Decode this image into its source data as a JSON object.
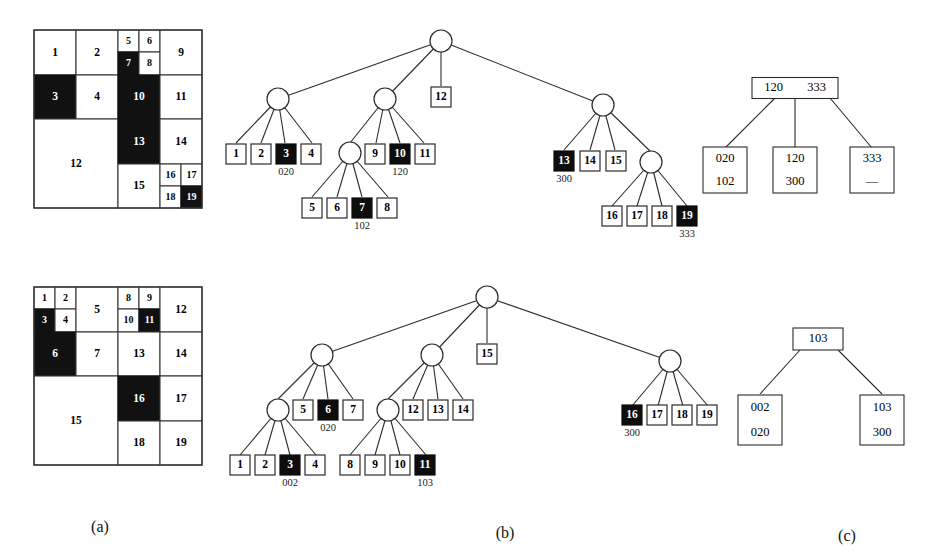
{
  "figure": {
    "captions": [
      {
        "id": "caption-a",
        "label": "(a)",
        "x": 100,
        "y": 528
      },
      {
        "id": "caption-b",
        "label": "(b)",
        "x": 505,
        "y": 534
      },
      {
        "id": "caption-c",
        "label": "(c)",
        "x": 847,
        "y": 537
      }
    ]
  },
  "panel_a_top": {
    "name": "quadtree-block-decomposition-top",
    "origin": {
      "x": 34,
      "y": 30
    },
    "size": {
      "w": 168,
      "h": 178
    },
    "cells": [
      {
        "label": "1",
        "x": 0,
        "y": 0,
        "w": 42,
        "h": 45,
        "filled": false
      },
      {
        "label": "2",
        "x": 42,
        "y": 0,
        "w": 42,
        "h": 45,
        "filled": false
      },
      {
        "label": "5",
        "x": 84,
        "y": 0,
        "w": 21,
        "h": 22,
        "filled": false
      },
      {
        "label": "6",
        "x": 105,
        "y": 0,
        "w": 21,
        "h": 22,
        "filled": false
      },
      {
        "label": "7",
        "x": 84,
        "y": 22,
        "w": 21,
        "h": 23,
        "filled": true
      },
      {
        "label": "8",
        "x": 105,
        "y": 22,
        "w": 21,
        "h": 23,
        "filled": false
      },
      {
        "label": "9",
        "x": 126,
        "y": 0,
        "w": 42,
        "h": 45,
        "filled": false
      },
      {
        "label": "3",
        "x": 0,
        "y": 45,
        "w": 42,
        "h": 44,
        "filled": true
      },
      {
        "label": "4",
        "x": 42,
        "y": 45,
        "w": 42,
        "h": 44,
        "filled": false
      },
      {
        "label": "10",
        "x": 84,
        "y": 45,
        "w": 42,
        "h": 44,
        "filled": true
      },
      {
        "label": "11",
        "x": 126,
        "y": 45,
        "w": 42,
        "h": 44,
        "filled": false
      },
      {
        "label": "12",
        "x": 0,
        "y": 89,
        "w": 84,
        "h": 89,
        "filled": false
      },
      {
        "label": "13",
        "x": 84,
        "y": 89,
        "w": 42,
        "h": 45,
        "filled": true
      },
      {
        "label": "14",
        "x": 126,
        "y": 89,
        "w": 42,
        "h": 45,
        "filled": false
      },
      {
        "label": "15",
        "x": 84,
        "y": 134,
        "w": 42,
        "h": 44,
        "filled": false
      },
      {
        "label": "16",
        "x": 126,
        "y": 134,
        "w": 21,
        "h": 22,
        "filled": false
      },
      {
        "label": "17",
        "x": 147,
        "y": 134,
        "w": 21,
        "h": 22,
        "filled": false
      },
      {
        "label": "18",
        "x": 126,
        "y": 156,
        "w": 21,
        "h": 22,
        "filled": false
      },
      {
        "label": "19",
        "x": 147,
        "y": 156,
        "w": 21,
        "h": 22,
        "filled": true
      }
    ]
  },
  "panel_a_bottom": {
    "name": "quadtree-block-decomposition-bottom",
    "origin": {
      "x": 34,
      "y": 287
    },
    "size": {
      "w": 168,
      "h": 178
    },
    "cells": [
      {
        "label": "1",
        "x": 0,
        "y": 0,
        "w": 21,
        "h": 22,
        "filled": false
      },
      {
        "label": "2",
        "x": 21,
        "y": 0,
        "w": 21,
        "h": 22,
        "filled": false
      },
      {
        "label": "3",
        "x": 0,
        "y": 22,
        "w": 21,
        "h": 23,
        "filled": true
      },
      {
        "label": "4",
        "x": 21,
        "y": 22,
        "w": 21,
        "h": 23,
        "filled": false
      },
      {
        "label": "5",
        "x": 42,
        "y": 0,
        "w": 42,
        "h": 45,
        "filled": false
      },
      {
        "label": "8",
        "x": 84,
        "y": 0,
        "w": 21,
        "h": 22,
        "filled": false
      },
      {
        "label": "9",
        "x": 105,
        "y": 0,
        "w": 21,
        "h": 22,
        "filled": false
      },
      {
        "label": "10",
        "x": 84,
        "y": 22,
        "w": 21,
        "h": 23,
        "filled": false
      },
      {
        "label": "11",
        "x": 105,
        "y": 22,
        "w": 21,
        "h": 23,
        "filled": true
      },
      {
        "label": "12",
        "x": 126,
        "y": 0,
        "w": 42,
        "h": 45,
        "filled": false
      },
      {
        "label": "6",
        "x": 0,
        "y": 45,
        "w": 42,
        "h": 44,
        "filled": true
      },
      {
        "label": "7",
        "x": 42,
        "y": 45,
        "w": 42,
        "h": 44,
        "filled": false
      },
      {
        "label": "13",
        "x": 84,
        "y": 45,
        "w": 42,
        "h": 44,
        "filled": false
      },
      {
        "label": "14",
        "x": 126,
        "y": 45,
        "w": 42,
        "h": 44,
        "filled": false
      },
      {
        "label": "15",
        "x": 0,
        "y": 89,
        "w": 84,
        "h": 89,
        "filled": false
      },
      {
        "label": "16",
        "x": 84,
        "y": 89,
        "w": 42,
        "h": 45,
        "filled": true
      },
      {
        "label": "17",
        "x": 126,
        "y": 89,
        "w": 42,
        "h": 45,
        "filled": false
      },
      {
        "label": "18",
        "x": 84,
        "y": 134,
        "w": 42,
        "h": 44,
        "filled": false
      },
      {
        "label": "19",
        "x": 126,
        "y": 134,
        "w": 42,
        "h": 44,
        "filled": false
      }
    ]
  },
  "panel_b_top": {
    "name": "quadtree-top",
    "circles": [
      {
        "id": "root",
        "x": 441,
        "y": 41,
        "r": 11
      },
      {
        "id": "n-a",
        "x": 278,
        "y": 99,
        "r": 11
      },
      {
        "id": "n-b",
        "x": 385,
        "y": 99,
        "r": 11
      },
      {
        "id": "n-c",
        "x": 350,
        "y": 153,
        "r": 11
      },
      {
        "id": "n-d",
        "x": 603,
        "y": 105,
        "r": 11
      },
      {
        "id": "n-e",
        "x": 651,
        "y": 162,
        "r": 11
      }
    ],
    "edges": [
      [
        441,
        41,
        278,
        99
      ],
      [
        441,
        41,
        385,
        99
      ],
      [
        441,
        41,
        441,
        86
      ],
      [
        441,
        41,
        603,
        105
      ],
      [
        278,
        99,
        236,
        143
      ],
      [
        278,
        99,
        261,
        143
      ],
      [
        278,
        99,
        285,
        143
      ],
      [
        278,
        99,
        312,
        143
      ],
      [
        385,
        99,
        350,
        143
      ],
      [
        385,
        99,
        376,
        143
      ],
      [
        385,
        99,
        400,
        143
      ],
      [
        385,
        99,
        424,
        143
      ],
      [
        350,
        153,
        312,
        197
      ],
      [
        350,
        153,
        337,
        197
      ],
      [
        350,
        153,
        362,
        197
      ],
      [
        350,
        153,
        388,
        197
      ],
      [
        603,
        105,
        564,
        150
      ],
      [
        603,
        105,
        590,
        150
      ],
      [
        603,
        105,
        615,
        150
      ],
      [
        603,
        105,
        651,
        152
      ],
      [
        651,
        162,
        612,
        206
      ],
      [
        651,
        162,
        637,
        206
      ],
      [
        651,
        162,
        662,
        206
      ],
      [
        651,
        162,
        687,
        206
      ]
    ],
    "leaves": [
      {
        "label": "1",
        "x": 236,
        "y": 154,
        "filled": false,
        "code": null
      },
      {
        "label": "2",
        "x": 261,
        "y": 154,
        "filled": false,
        "code": null
      },
      {
        "label": "3",
        "x": 286,
        "y": 154,
        "filled": true,
        "code": "020"
      },
      {
        "label": "4",
        "x": 311,
        "y": 154,
        "filled": false,
        "code": null
      },
      {
        "label": "9",
        "x": 375,
        "y": 154,
        "filled": false,
        "code": null
      },
      {
        "label": "10",
        "x": 400,
        "y": 154,
        "filled": true,
        "code": "120"
      },
      {
        "label": "11",
        "x": 425,
        "y": 154,
        "filled": false,
        "code": null
      },
      {
        "label": "5",
        "x": 312,
        "y": 208,
        "filled": false,
        "code": null
      },
      {
        "label": "6",
        "x": 337,
        "y": 208,
        "filled": false,
        "code": null
      },
      {
        "label": "7",
        "x": 362,
        "y": 208,
        "filled": true,
        "code": "102"
      },
      {
        "label": "8",
        "x": 387,
        "y": 208,
        "filled": false,
        "code": null
      },
      {
        "label": "12",
        "x": 441,
        "y": 97,
        "filled": false,
        "code": null
      },
      {
        "label": "13",
        "x": 564,
        "y": 161,
        "filled": true,
        "code": "300"
      },
      {
        "label": "14",
        "x": 590,
        "y": 161,
        "filled": false,
        "code": null
      },
      {
        "label": "15",
        "x": 616,
        "y": 161,
        "filled": false,
        "code": null
      },
      {
        "label": "16",
        "x": 612,
        "y": 216,
        "filled": false,
        "code": null
      },
      {
        "label": "17",
        "x": 637,
        "y": 216,
        "filled": false,
        "code": null
      },
      {
        "label": "18",
        "x": 662,
        "y": 216,
        "filled": false,
        "code": null
      },
      {
        "label": "19",
        "x": 687,
        "y": 216,
        "filled": true,
        "code": "333"
      }
    ]
  },
  "panel_b_bottom": {
    "name": "quadtree-bottom",
    "circles": [
      {
        "id": "root",
        "x": 487,
        "y": 297,
        "r": 11
      },
      {
        "id": "n-a",
        "x": 322,
        "y": 355,
        "r": 11
      },
      {
        "id": "n-b",
        "x": 432,
        "y": 355,
        "r": 11
      },
      {
        "id": "n-c",
        "x": 278,
        "y": 410,
        "r": 11
      },
      {
        "id": "n-d",
        "x": 388,
        "y": 410,
        "r": 11
      },
      {
        "id": "n-e",
        "x": 670,
        "y": 361,
        "r": 11
      }
    ],
    "edges": [
      [
        487,
        297,
        322,
        355
      ],
      [
        487,
        297,
        432,
        355
      ],
      [
        487,
        297,
        487,
        343
      ],
      [
        487,
        297,
        670,
        361
      ],
      [
        322,
        355,
        278,
        399
      ],
      [
        322,
        355,
        303,
        399
      ],
      [
        322,
        355,
        328,
        399
      ],
      [
        322,
        355,
        353,
        399
      ],
      [
        432,
        355,
        388,
        399
      ],
      [
        432,
        355,
        413,
        399
      ],
      [
        432,
        355,
        438,
        399
      ],
      [
        432,
        355,
        463,
        399
      ],
      [
        278,
        410,
        240,
        455
      ],
      [
        278,
        410,
        265,
        455
      ],
      [
        278,
        410,
        290,
        455
      ],
      [
        278,
        410,
        316,
        455
      ],
      [
        388,
        410,
        350,
        455
      ],
      [
        388,
        410,
        375,
        455
      ],
      [
        388,
        410,
        400,
        455
      ],
      [
        388,
        410,
        426,
        455
      ],
      [
        670,
        361,
        632,
        406
      ],
      [
        670,
        361,
        658,
        406
      ],
      [
        670,
        361,
        683,
        406
      ],
      [
        670,
        361,
        708,
        406
      ]
    ],
    "leaves": [
      {
        "label": "5",
        "x": 303,
        "y": 410,
        "filled": false,
        "code": null
      },
      {
        "label": "6",
        "x": 328,
        "y": 410,
        "filled": true,
        "code": "020"
      },
      {
        "label": "7",
        "x": 353,
        "y": 410,
        "filled": false,
        "code": null
      },
      {
        "label": "12",
        "x": 413,
        "y": 410,
        "filled": false,
        "code": null
      },
      {
        "label": "13",
        "x": 438,
        "y": 410,
        "filled": false,
        "code": null
      },
      {
        "label": "14",
        "x": 463,
        "y": 410,
        "filled": false,
        "code": null
      },
      {
        "label": "1",
        "x": 240,
        "y": 465,
        "filled": false,
        "code": null
      },
      {
        "label": "2",
        "x": 265,
        "y": 465,
        "filled": false,
        "code": null
      },
      {
        "label": "3",
        "x": 290,
        "y": 465,
        "filled": true,
        "code": "002"
      },
      {
        "label": "4",
        "x": 315,
        "y": 465,
        "filled": false,
        "code": null
      },
      {
        "label": "8",
        "x": 350,
        "y": 465,
        "filled": false,
        "code": null
      },
      {
        "label": "9",
        "x": 375,
        "y": 465,
        "filled": false,
        "code": null
      },
      {
        "label": "10",
        "x": 400,
        "y": 465,
        "filled": false,
        "code": null
      },
      {
        "label": "11",
        "x": 425,
        "y": 465,
        "filled": true,
        "code": "103"
      },
      {
        "label": "15",
        "x": 487,
        "y": 354,
        "filled": false,
        "code": null
      },
      {
        "label": "16",
        "x": 632,
        "y": 415,
        "filled": true,
        "code": "300"
      },
      {
        "label": "17",
        "x": 657,
        "y": 415,
        "filled": false,
        "code": null
      },
      {
        "label": "18",
        "x": 682,
        "y": 415,
        "filled": false,
        "code": null
      },
      {
        "label": "19",
        "x": 707,
        "y": 415,
        "filled": false,
        "code": null
      }
    ]
  },
  "panel_c_top": {
    "name": "btree-top",
    "root": {
      "x": 795,
      "y": 88,
      "w": 86,
      "h": 21,
      "keys": [
        "120",
        "333"
      ]
    },
    "edges": [
      [
        775,
        98,
        725,
        148
      ],
      [
        795,
        98,
        795,
        148
      ],
      [
        830,
        98,
        872,
        148
      ]
    ],
    "children": [
      {
        "x": 725,
        "y": 170,
        "w": 44,
        "h": 46,
        "lines": [
          "020",
          "102"
        ]
      },
      {
        "x": 795,
        "y": 170,
        "w": 44,
        "h": 46,
        "lines": [
          "120",
          "300"
        ]
      },
      {
        "x": 872,
        "y": 170,
        "w": 44,
        "h": 46,
        "lines": [
          "333",
          "—"
        ]
      }
    ]
  },
  "panel_c_bottom": {
    "name": "btree-bottom",
    "root": {
      "x": 818,
      "y": 339,
      "w": 50,
      "h": 22,
      "keys": [
        "103"
      ]
    },
    "edges": [
      [
        800,
        350,
        760,
        394
      ],
      [
        838,
        350,
        882,
        394
      ]
    ],
    "children": [
      {
        "x": 760,
        "y": 420,
        "w": 44,
        "h": 50,
        "lines": [
          "002",
          "020"
        ]
      },
      {
        "x": 882,
        "y": 420,
        "w": 44,
        "h": 50,
        "lines": [
          "103",
          "300"
        ]
      }
    ]
  }
}
